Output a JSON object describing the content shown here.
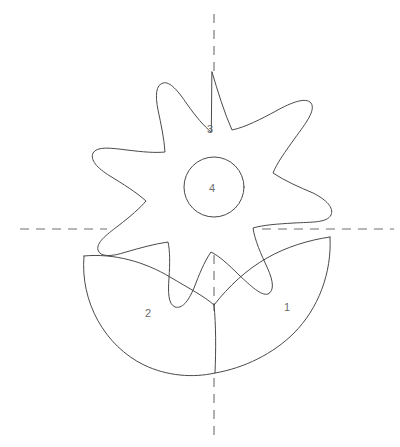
{
  "figure": {
    "background_color": "#ffffff",
    "stroke_color": "#4a4a4a",
    "axis_color": "#6e6e6e",
    "label_color": "#6b6b6b",
    "canvas": {
      "width": 400,
      "height": 447
    }
  },
  "labels": {
    "region_1": "1",
    "region_2": "2",
    "region_3": "3",
    "region_4": "4"
  },
  "label_positions": {
    "region_1": {
      "x": 287,
      "y": 308
    },
    "region_2": {
      "x": 148,
      "y": 314
    },
    "region_3": {
      "x": 210,
      "y": 130
    },
    "region_4": {
      "x": 212,
      "y": 189
    }
  },
  "axes": {
    "vertical": {
      "name": "vertical-symmetry-axis",
      "x": 214,
      "segments": [
        {
          "y1": 14,
          "y2": 73
        },
        {
          "y1": 255,
          "y2": 311
        },
        {
          "y1": 378,
          "y2": 436
        }
      ]
    },
    "horizontal": {
      "name": "horizontal-symmetry-axis",
      "y": 229,
      "segments": [
        {
          "x1": 20,
          "x2": 107
        },
        {
          "x1": 262,
          "x2": 394
        }
      ]
    }
  },
  "shapes": {
    "star": {
      "name": "seven-pointed-star-outline",
      "points": 7,
      "center": {
        "x": 214,
        "y": 187
      },
      "path": "M214,73 C222,99 228,118 235,134 C248,130 262,122 276,114 C292,104 305,98 310,103 C315,109 306,122 295,137 C285,151 277,162 272,172 C284,180 298,186 312,192 C326,198 334,206 331,213 C327,221 311,221 294,222 C276,223 262,224 252,227 C254,240 260,253 266,265 C273,280 274,290 268,293 C261,296 250,286 238,274 C227,263 218,255 210,251 C203,261 198,274 193,287 C187,301 181,308 174,306 C167,303 167,291 168,277 C169,262 169,250 167,241 C153,243 139,247 125,251 C110,256 99,256 97,249 C95,242 105,234 117,225 C130,215 139,207 145,200 C135,191 122,183 109,175 C96,167 89,159 92,152 C96,145 110,147 126,149 C142,151 154,152 164,151 C163,137 160,123 157,109 C154,94 155,84 162,82 C169,80 177,90 186,103 C195,116 203,125 210,131 Z"
    },
    "inner_circle": {
      "name": "center-circle",
      "cx": 214,
      "cy": 187,
      "r": 30
    },
    "bowl": {
      "name": "bowl-outline",
      "left_rim": {
        "x": 84,
        "y": 256
      },
      "right_rim": {
        "x": 330,
        "y": 237
      },
      "bottom": {
        "x": 214,
        "y": 373
      },
      "path": "M84,256 C80,300 104,345 143,364 C166,375 192,377 214,373 C243,368 272,355 293,334 C317,310 332,274 330,237",
      "rim_right_path": "M330,237 C310,239 287,246 268,257 C247,269 230,285 214,304",
      "rim_left_path": "M84,256 C112,254 142,261 167,275 C186,286 202,294 214,304",
      "seam_path": "M214,304 C216,324 216,348 215,373"
    }
  }
}
